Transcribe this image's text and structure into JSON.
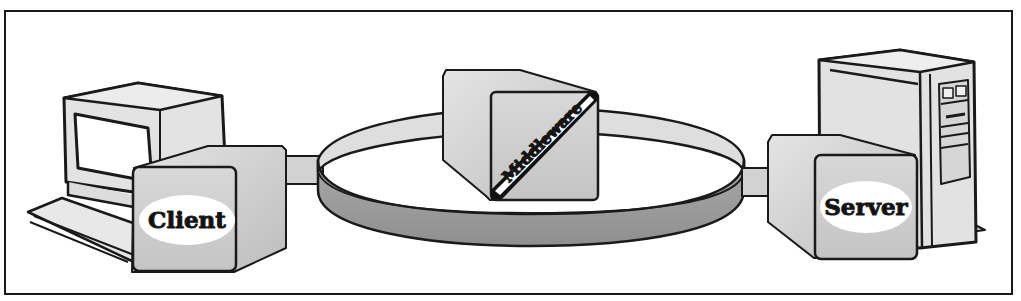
{
  "diagram": {
    "type": "client-middleware-server architecture",
    "nodes": [
      {
        "id": "client",
        "label": "Client",
        "device": "desktop-terminal"
      },
      {
        "id": "middleware",
        "label": "Middleware",
        "device": "ring-bus"
      },
      {
        "id": "server",
        "label": "Server",
        "device": "tower-server"
      }
    ],
    "edges": [
      {
        "from": "client",
        "to": "middleware"
      },
      {
        "from": "middleware",
        "to": "server"
      }
    ]
  },
  "labels": {
    "client": "Client",
    "middleware": "Middleware",
    "server": "Server"
  },
  "colors": {
    "outline": "#1a1a1a",
    "box_face": "#cfcfcf",
    "box_light": "#e2e2e2",
    "box_dark": "#b4b4b4",
    "ring_top": "#dcdcdc",
    "ring_side": "#9e9e9e",
    "label_bg": "#ffffff"
  }
}
